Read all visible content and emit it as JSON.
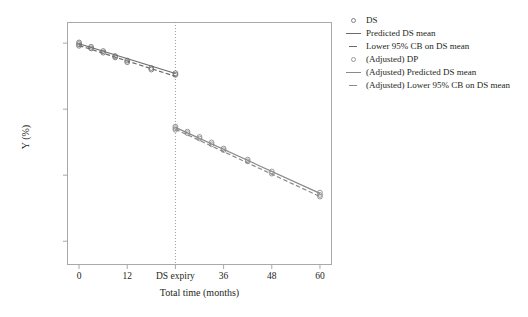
{
  "chart_data": {
    "type": "scatter",
    "title": "",
    "xlabel": "Total time (months)",
    "ylabel": "Y (%)",
    "xlim": [
      -3,
      63
    ],
    "ylim": [
      78.2,
      96.6
    ],
    "grid": false,
    "xticks": [
      {
        "value": 0,
        "label": "0"
      },
      {
        "value": 12,
        "label": "12"
      },
      {
        "value": 24,
        "label": "DS expiry"
      },
      {
        "value": 36,
        "label": "36"
      },
      {
        "value": 48,
        "label": "48"
      },
      {
        "value": 60,
        "label": "60"
      }
    ],
    "yticks": [
      {
        "value": 95,
        "label": "95"
      },
      {
        "value": 90,
        "label": "90"
      },
      {
        "value": 85,
        "label": "85"
      },
      {
        "value": 80,
        "label": "AC = 80"
      }
    ],
    "annotations": [
      {
        "name": "ds-expiry-vline",
        "type": "vline",
        "x": 24,
        "style": "dotted",
        "color": "#9a9a9a"
      },
      {
        "name": "acceptance-criterion",
        "type": "hline-tick",
        "y": 80,
        "label": "AC = 80"
      }
    ],
    "legend": {
      "position": "right",
      "entries": [
        {
          "label": "DS",
          "key": "circle",
          "color": "#808080"
        },
        {
          "label": "Predicted DS mean",
          "key": "solid-line",
          "color": "#6b6b6b"
        },
        {
          "label": "Lower 95% CB on DS mean",
          "key": "dashed-line",
          "color": "#6b6b6b"
        },
        {
          "label": "(Adjusted) DP",
          "key": "circle",
          "color": "#9a9a9a"
        },
        {
          "label": "(Adjusted) Predicted DS mean",
          "key": "solid-line",
          "color": "#8a8a8a"
        },
        {
          "label": "(Adjusted) Lower 95% CB on DS mean",
          "key": "dashed-line",
          "color": "#8a8a8a"
        }
      ]
    },
    "series": [
      {
        "name": "DS",
        "type": "scatter",
        "marker": "open-circle",
        "color": "#808080",
        "points": [
          {
            "x": 0,
            "y": 95.05
          },
          {
            "x": 0,
            "y": 94.92
          },
          {
            "x": 0,
            "y": 94.8
          },
          {
            "x": 3,
            "y": 94.72
          },
          {
            "x": 3,
            "y": 94.6
          },
          {
            "x": 6,
            "y": 94.4
          },
          {
            "x": 6,
            "y": 94.28
          },
          {
            "x": 9,
            "y": 94.02
          },
          {
            "x": 9,
            "y": 93.92
          },
          {
            "x": 12,
            "y": 93.68
          },
          {
            "x": 12,
            "y": 93.56
          },
          {
            "x": 18,
            "y": 93.12
          },
          {
            "x": 18,
            "y": 93.0
          },
          {
            "x": 24,
            "y": 92.72
          },
          {
            "x": 24,
            "y": 92.6
          }
        ]
      },
      {
        "name": "Predicted DS mean",
        "type": "line",
        "style": "solid",
        "color": "#6b6b6b",
        "points": [
          {
            "x": 0,
            "y": 94.95
          },
          {
            "x": 24,
            "y": 92.7
          }
        ]
      },
      {
        "name": "Lower 95% CB on DS mean",
        "type": "line",
        "style": "dashed",
        "color": "#6b6b6b",
        "points": [
          {
            "x": 0,
            "y": 94.82
          },
          {
            "x": 24,
            "y": 92.48
          }
        ]
      },
      {
        "name": "(Adjusted) DP",
        "type": "scatter",
        "marker": "open-circle",
        "color": "#9a9a9a",
        "points": [
          {
            "x": 24,
            "y": 88.68
          },
          {
            "x": 24,
            "y": 88.56
          },
          {
            "x": 24,
            "y": 88.44
          },
          {
            "x": 27,
            "y": 88.3
          },
          {
            "x": 27,
            "y": 88.18
          },
          {
            "x": 30,
            "y": 87.9
          },
          {
            "x": 30,
            "y": 87.78
          },
          {
            "x": 33,
            "y": 87.48
          },
          {
            "x": 33,
            "y": 87.34
          },
          {
            "x": 36,
            "y": 87.02
          },
          {
            "x": 36,
            "y": 86.9
          },
          {
            "x": 42,
            "y": 86.18
          },
          {
            "x": 42,
            "y": 86.05
          },
          {
            "x": 48,
            "y": 85.28
          },
          {
            "x": 48,
            "y": 85.12
          },
          {
            "x": 60,
            "y": 83.68
          },
          {
            "x": 60,
            "y": 83.5
          },
          {
            "x": 60,
            "y": 83.38
          }
        ]
      },
      {
        "name": "(Adjusted) Predicted DS mean",
        "type": "line",
        "style": "solid",
        "color": "#8a8a8a",
        "points": [
          {
            "x": 24,
            "y": 88.62
          },
          {
            "x": 60,
            "y": 83.62
          }
        ]
      },
      {
        "name": "(Adjusted) Lower 95% CB on DS mean",
        "type": "line",
        "style": "dashed",
        "color": "#8a8a8a",
        "points": [
          {
            "x": 24,
            "y": 88.48
          },
          {
            "x": 60,
            "y": 83.38
          }
        ]
      }
    ]
  }
}
